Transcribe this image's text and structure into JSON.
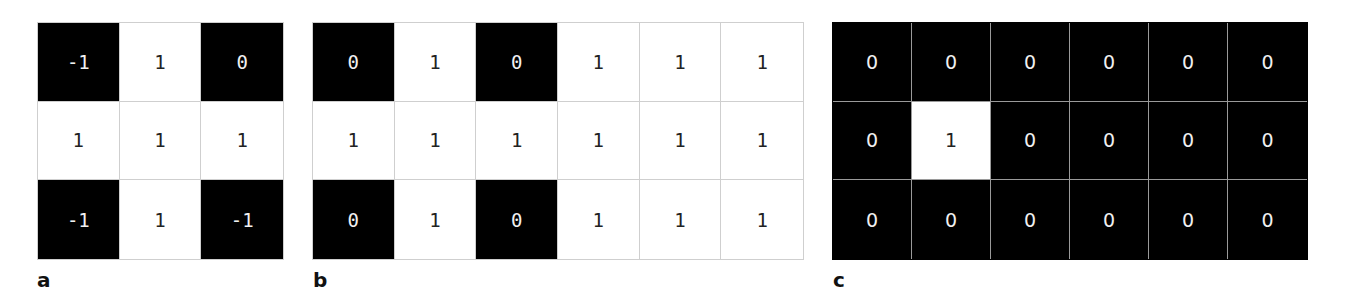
{
  "panels": [
    {
      "label": "a",
      "rows": 3,
      "cols": 3,
      "values": [
        [
          "-1",
          "1",
          "0"
        ],
        [
          "1",
          "1",
          "1"
        ],
        [
          "-1",
          "1",
          "-1"
        ]
      ],
      "dark": [
        [
          1,
          0,
          1
        ],
        [
          0,
          0,
          0
        ],
        [
          1,
          0,
          1
        ]
      ]
    },
    {
      "label": "b",
      "rows": 3,
      "cols": 6,
      "values": [
        [
          "0",
          "1",
          "0",
          "1",
          "1",
          "1"
        ],
        [
          "1",
          "1",
          "1",
          "1",
          "1",
          "1"
        ],
        [
          "0",
          "1",
          "0",
          "1",
          "1",
          "1"
        ]
      ],
      "dark": [
        [
          1,
          0,
          1,
          0,
          0,
          0
        ],
        [
          0,
          0,
          0,
          0,
          0,
          0
        ],
        [
          1,
          0,
          1,
          0,
          0,
          0
        ]
      ]
    },
    {
      "label": "c",
      "rows": 3,
      "cols": 6,
      "values": [
        [
          "0",
          "0",
          "0",
          "0",
          "0",
          "0"
        ],
        [
          "0",
          "1",
          "0",
          "0",
          "0",
          "0"
        ],
        [
          "0",
          "0",
          "0",
          "0",
          "0",
          "0"
        ]
      ],
      "dark": [
        [
          1,
          1,
          1,
          1,
          1,
          1
        ],
        [
          1,
          0,
          1,
          1,
          1,
          1
        ],
        [
          1,
          1,
          1,
          1,
          1,
          1
        ]
      ]
    }
  ],
  "colors": {
    "dark_cell": "#000000",
    "light_cell": "#ffffff",
    "grid_line": "#cfcfcf"
  }
}
